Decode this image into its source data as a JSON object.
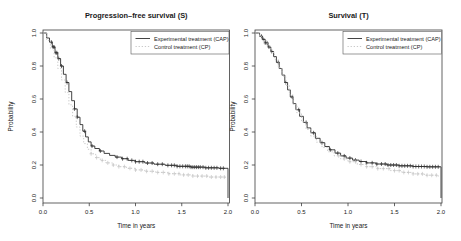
{
  "figure": {
    "background": "#ffffff",
    "axis_color": "#3c3c3c",
    "text_color": "#1a1a1a"
  },
  "chart_data": [
    {
      "type": "line",
      "subtype": "kaplan_meier_step",
      "title": "Progression–free survival (S)",
      "xlabel": "Time in years",
      "ylabel": "Probability",
      "xlim": [
        0.0,
        2.0
      ],
      "ylim": [
        0.0,
        1.0
      ],
      "xticks": [
        "0.0",
        "0.5",
        "1.0",
        "1.5",
        "2.0"
      ],
      "yticks": [
        "0.0",
        "0.2",
        "0.4",
        "0.6",
        "0.8",
        "1.0"
      ],
      "grid": false,
      "legend_position": "top-right",
      "series": [
        {
          "name": "Experimental treatment (CAP)",
          "color": "#2f2f2f",
          "line_style": "solid",
          "end_drop_to_zero": true,
          "points": [
            [
              0,
              1.0
            ],
            [
              0.04,
              0.97
            ],
            [
              0.07,
              0.945
            ],
            [
              0.1,
              0.915
            ],
            [
              0.13,
              0.88
            ],
            [
              0.16,
              0.845
            ],
            [
              0.19,
              0.8
            ],
            [
              0.22,
              0.75
            ],
            [
              0.25,
              0.7
            ],
            [
              0.28,
              0.645
            ],
            [
              0.31,
              0.59
            ],
            [
              0.34,
              0.54
            ],
            [
              0.37,
              0.49
            ],
            [
              0.4,
              0.445
            ],
            [
              0.43,
              0.405
            ],
            [
              0.46,
              0.37
            ],
            [
              0.49,
              0.34
            ],
            [
              0.52,
              0.315
            ],
            [
              0.56,
              0.3
            ],
            [
              0.61,
              0.285
            ],
            [
              0.66,
              0.27
            ],
            [
              0.72,
              0.258
            ],
            [
              0.78,
              0.248
            ],
            [
              0.85,
              0.238
            ],
            [
              0.92,
              0.228
            ],
            [
              1.0,
              0.22
            ],
            [
              1.1,
              0.212
            ],
            [
              1.2,
              0.205
            ],
            [
              1.32,
              0.198
            ],
            [
              1.45,
              0.192
            ],
            [
              1.6,
              0.187
            ],
            [
              1.75,
              0.183
            ],
            [
              1.9,
              0.18
            ],
            [
              2.0,
              0.18
            ]
          ],
          "censor_times": [
            0.09,
            0.11,
            0.12,
            0.14,
            0.15,
            0.17,
            0.2,
            0.26,
            0.34,
            0.37,
            0.45,
            0.53,
            0.62,
            0.8,
            0.86,
            0.91,
            0.96,
            1.0,
            1.04,
            1.08,
            1.13,
            1.18,
            1.24,
            1.29,
            1.35,
            1.39,
            1.42,
            1.45,
            1.48,
            1.51,
            1.54,
            1.56,
            1.58,
            1.6,
            1.62,
            1.64,
            1.66,
            1.68,
            1.7,
            1.73,
            1.76,
            1.79,
            1.82,
            1.85,
            1.88,
            1.92,
            1.95
          ]
        },
        {
          "name": "Control treatment (CP)",
          "color": "#c4c4c4",
          "line_style": "dotted",
          "end_drop_to_zero": false,
          "points": [
            [
              0,
              1.0
            ],
            [
              0.04,
              0.955
            ],
            [
              0.08,
              0.905
            ],
            [
              0.12,
              0.85
            ],
            [
              0.16,
              0.785
            ],
            [
              0.2,
              0.715
            ],
            [
              0.24,
              0.64
            ],
            [
              0.28,
              0.565
            ],
            [
              0.32,
              0.495
            ],
            [
              0.36,
              0.43
            ],
            [
              0.4,
              0.375
            ],
            [
              0.44,
              0.33
            ],
            [
              0.48,
              0.295
            ],
            [
              0.52,
              0.268
            ],
            [
              0.57,
              0.245
            ],
            [
              0.62,
              0.228
            ],
            [
              0.68,
              0.213
            ],
            [
              0.75,
              0.2
            ],
            [
              0.82,
              0.19
            ],
            [
              0.9,
              0.18
            ],
            [
              1.0,
              0.17
            ],
            [
              1.1,
              0.162
            ],
            [
              1.22,
              0.155
            ],
            [
              1.35,
              0.147
            ],
            [
              1.48,
              0.14
            ],
            [
              1.62,
              0.133
            ],
            [
              1.78,
              0.127
            ],
            [
              1.97,
              0.122
            ]
          ],
          "censor_times": [
            0.52,
            0.58,
            0.64,
            0.7,
            0.76,
            0.82,
            0.88,
            0.94,
            1.0,
            1.06,
            1.12,
            1.18,
            1.24,
            1.3,
            1.36,
            1.42,
            1.47,
            1.52,
            1.57,
            1.62,
            1.67,
            1.72,
            1.77,
            1.82,
            1.87,
            1.92,
            1.96
          ]
        }
      ]
    },
    {
      "type": "line",
      "subtype": "kaplan_meier_step",
      "title": "Survival (T)",
      "xlabel": "Time in years",
      "ylabel": "Probability",
      "xlim": [
        0.0,
        2.0
      ],
      "ylim": [
        0.0,
        1.0
      ],
      "xticks": [
        "0.0",
        "0.5",
        "1.0",
        "1.5",
        "2.0"
      ],
      "yticks": [
        "0.0",
        "0.2",
        "0.4",
        "0.6",
        "0.8",
        "1.0"
      ],
      "grid": false,
      "legend_position": "top-right",
      "series": [
        {
          "name": "Experimental treatment (CAP)",
          "color": "#2f2f2f",
          "line_style": "solid",
          "end_drop_to_zero": true,
          "points": [
            [
              0,
              1.0
            ],
            [
              0.05,
              0.98
            ],
            [
              0.08,
              0.962
            ],
            [
              0.11,
              0.94
            ],
            [
              0.14,
              0.915
            ],
            [
              0.17,
              0.888
            ],
            [
              0.2,
              0.857
            ],
            [
              0.23,
              0.822
            ],
            [
              0.26,
              0.785
            ],
            [
              0.29,
              0.745
            ],
            [
              0.32,
              0.7
            ],
            [
              0.35,
              0.655
            ],
            [
              0.38,
              0.612
            ],
            [
              0.41,
              0.572
            ],
            [
              0.44,
              0.535
            ],
            [
              0.48,
              0.495
            ],
            [
              0.52,
              0.458
            ],
            [
              0.56,
              0.425
            ],
            [
              0.6,
              0.395
            ],
            [
              0.65,
              0.362
            ],
            [
              0.7,
              0.335
            ],
            [
              0.75,
              0.312
            ],
            [
              0.8,
              0.292
            ],
            [
              0.86,
              0.272
            ],
            [
              0.92,
              0.255
            ],
            [
              0.98,
              0.242
            ],
            [
              1.05,
              0.23
            ],
            [
              1.12,
              0.221
            ],
            [
              1.2,
              0.213
            ],
            [
              1.3,
              0.206
            ],
            [
              1.42,
              0.2
            ],
            [
              1.55,
              0.195
            ],
            [
              1.7,
              0.191
            ],
            [
              1.85,
              0.189
            ],
            [
              2.0,
              0.188
            ]
          ],
          "censor_times": [
            0.07,
            0.09,
            0.11,
            0.13,
            0.15,
            0.18,
            0.25,
            0.33,
            0.4,
            0.47,
            0.55,
            0.63,
            0.72,
            0.81,
            0.89,
            0.96,
            1.02,
            1.08,
            1.14,
            1.2,
            1.26,
            1.31,
            1.36,
            1.4,
            1.43,
            1.46,
            1.49,
            1.52,
            1.55,
            1.58,
            1.61,
            1.64,
            1.67,
            1.7,
            1.73,
            1.76,
            1.79,
            1.82,
            1.85,
            1.88,
            1.91,
            1.94,
            1.97
          ]
        },
        {
          "name": "Control treatment (CP)",
          "color": "#c4c4c4",
          "line_style": "dotted",
          "end_drop_to_zero": false,
          "points": [
            [
              0,
              1.0
            ],
            [
              0.05,
              0.978
            ],
            [
              0.09,
              0.952
            ],
            [
              0.13,
              0.92
            ],
            [
              0.17,
              0.882
            ],
            [
              0.21,
              0.838
            ],
            [
              0.25,
              0.79
            ],
            [
              0.29,
              0.738
            ],
            [
              0.33,
              0.682
            ],
            [
              0.37,
              0.625
            ],
            [
              0.41,
              0.568
            ],
            [
              0.45,
              0.515
            ],
            [
              0.5,
              0.462
            ],
            [
              0.55,
              0.415
            ],
            [
              0.6,
              0.375
            ],
            [
              0.66,
              0.338
            ],
            [
              0.72,
              0.306
            ],
            [
              0.78,
              0.28
            ],
            [
              0.85,
              0.256
            ],
            [
              0.92,
              0.237
            ],
            [
              1.0,
              0.22
            ],
            [
              1.1,
              0.203
            ],
            [
              1.2,
              0.19
            ],
            [
              1.32,
              0.178
            ],
            [
              1.45,
              0.166
            ],
            [
              1.58,
              0.155
            ],
            [
              1.7,
              0.146
            ],
            [
              1.82,
              0.138
            ],
            [
              1.97,
              0.128
            ]
          ],
          "censor_times": [
            0.9,
            0.96,
            1.02,
            1.08,
            1.14,
            1.2,
            1.26,
            1.32,
            1.38,
            1.44,
            1.5,
            1.55,
            1.6,
            1.65,
            1.7,
            1.75,
            1.8,
            1.85,
            1.9,
            1.95
          ]
        }
      ]
    }
  ]
}
